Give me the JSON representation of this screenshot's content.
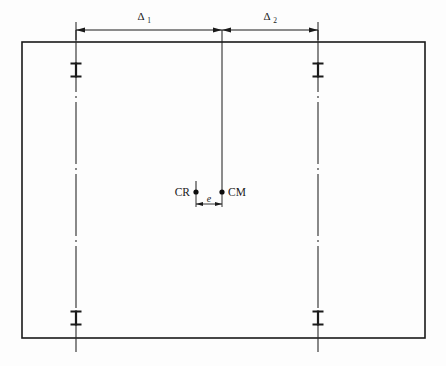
{
  "diagram": {
    "title": "Plan view of floor slab with two structural columns showing eccentricity between centre of rigidity and centre of mass",
    "background_color": "#fdfdfd",
    "line_color": "#1a1a1a",
    "canvas": {
      "width": 446,
      "height": 366
    },
    "slab": {
      "name": "floor-slab-outline",
      "left": 22,
      "top": 42,
      "right": 425,
      "bottom": 338,
      "stroke_width": 1.6
    },
    "columns": [
      {
        "id": "column-left",
        "label": "left-column-centerline",
        "x": 76,
        "line_top": 30,
        "line_bottom": 352,
        "ibeam_top_y": 70,
        "ibeam_bottom_y": 318
      },
      {
        "id": "column-right",
        "label": "right-column-centerline",
        "x": 318,
        "line_top": 30,
        "line_bottom": 352,
        "ibeam_top_y": 70,
        "ibeam_bottom_y": 318
      }
    ],
    "ibeam": {
      "name": "i-beam-section-marker",
      "flange_half_width": 5.5,
      "half_height": 7.5,
      "web_width": 2.2,
      "flange_thickness": 2.0
    },
    "center_mass_line": {
      "name": "center-of-mass-vertical-line",
      "x": 222,
      "top": 30,
      "bottom": 192
    },
    "dimensions": [
      {
        "id": "dim-delta-1",
        "label": "Δ",
        "subscript": "1",
        "label_full": "Δ1",
        "y": 30,
        "x_start": 76,
        "x_end": 222,
        "label_x": 146,
        "label_y": 20
      },
      {
        "id": "dim-delta-2",
        "label": "Δ",
        "subscript": "2",
        "label_full": "Δ2",
        "y": 30,
        "x_start": 222,
        "x_end": 318,
        "label_x": 272,
        "label_y": 20
      },
      {
        "id": "dim-eccentricity",
        "label": "e",
        "y": 204,
        "x_start": 196,
        "x_end": 222,
        "label_x": 209,
        "label_y": 202
      }
    ],
    "points": [
      {
        "id": "point-cr",
        "label": "CR",
        "meaning": "centre of rigidity",
        "x": 196,
        "y": 192,
        "radius": 2.6,
        "label_x": 191,
        "label_y": 196,
        "label_anchor": "end"
      },
      {
        "id": "point-cm",
        "label": "CM",
        "meaning": "centre of mass",
        "x": 222,
        "y": 192,
        "radius": 2.6,
        "label_x": 228,
        "label_y": 196,
        "label_anchor": "start"
      }
    ]
  }
}
